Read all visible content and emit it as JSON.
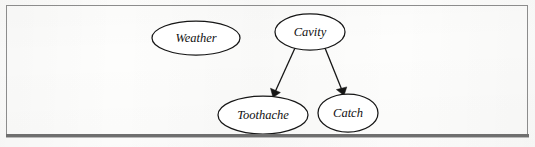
{
  "figure": {
    "type": "bayesian-network-diagram",
    "caption_bleed_text": "",
    "border_color": "#8c8c8c",
    "rule_color": "#6f6f6f",
    "background_color": "#fdfdfc",
    "stroke_color": "#161616"
  },
  "graph": {
    "nodes": [
      {
        "id": "weather",
        "label": "Weather",
        "cx": 196,
        "cy": 38,
        "rx": 44,
        "ry": 17
      },
      {
        "id": "cavity",
        "label": "Cavity",
        "cx": 310,
        "cy": 32,
        "rx": 35,
        "ry": 18
      },
      {
        "id": "toothache",
        "label": "Toothache",
        "cx": 263,
        "cy": 115,
        "rx": 45,
        "ry": 19
      },
      {
        "id": "catch",
        "label": "Catch",
        "cx": 348,
        "cy": 113,
        "rx": 30,
        "ry": 19
      }
    ],
    "edges": [
      {
        "id": "cavity-to-toothache",
        "from": "cavity",
        "to": "toothache",
        "x1": 295,
        "y1": 48,
        "x2": 273,
        "y2": 97,
        "arrow": true
      },
      {
        "id": "cavity-to-catch",
        "from": "cavity",
        "to": "catch",
        "x1": 325,
        "y1": 48,
        "x2": 344,
        "y2": 95,
        "arrow": true
      }
    ]
  }
}
